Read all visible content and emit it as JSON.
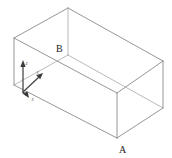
{
  "figure": {
    "background_color": "#ffffff",
    "edge_color": "#8a8a8a",
    "hidden_edge_color": "#a8a8a8",
    "axis_color": "#3a3a3a",
    "label_color": "#1b1b1b",
    "axis_label_color": "#6e6e6e"
  },
  "vertex_labels": {
    "a": "A",
    "b": "B"
  },
  "axes": {
    "x": "x",
    "y": "y",
    "z": "z"
  },
  "geometry": {
    "projection": "isometric",
    "shape": "rectangular-box",
    "vertices": {
      "top_back": [
        68,
        8
      ],
      "top_left": [
        14,
        38
      ],
      "top_right": [
        163,
        61
      ],
      "top_front": [
        117,
        93
      ],
      "bottom_left": [
        14,
        85
      ],
      "bottom_right": [
        163,
        108
      ],
      "bottom_front": [
        117,
        138
      ],
      "bottom_back": [
        68,
        55
      ]
    }
  }
}
